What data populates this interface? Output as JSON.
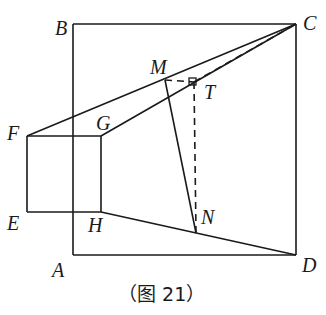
{
  "figure": {
    "caption": "（图 21）",
    "points": {
      "A": {
        "label": "A",
        "x": 73,
        "y": 255
      },
      "B": {
        "label": "B",
        "x": 73,
        "y": 24
      },
      "C": {
        "label": "C",
        "x": 296,
        "y": 24
      },
      "D": {
        "label": "D",
        "x": 296,
        "y": 255
      },
      "E": {
        "label": "E",
        "x": 27,
        "y": 212
      },
      "F": {
        "label": "F",
        "x": 27,
        "y": 136
      },
      "G": {
        "label": "G",
        "x": 101,
        "y": 136
      },
      "H": {
        "label": "H",
        "x": 101,
        "y": 212
      },
      "M": {
        "label": "M",
        "x": 165,
        "y": 80
      },
      "T": {
        "label": "T",
        "x": 194,
        "y": 82
      },
      "N": {
        "label": "N",
        "x": 196,
        "y": 233
      }
    },
    "segments_solid": [
      "AB",
      "BC",
      "CD",
      "DA",
      "EF",
      "FG",
      "GH",
      "HE",
      "FC",
      "GC",
      "HD",
      "MN"
    ],
    "segments_dashed": [
      "MT",
      "TN",
      "TC"
    ],
    "right_angle_mark": "T"
  }
}
